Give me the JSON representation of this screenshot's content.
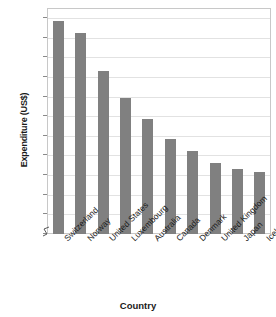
{
  "chart_data": {
    "type": "bar",
    "title": "",
    "xlabel": "Country",
    "ylabel": "Expenditure (US$)",
    "categories": [
      "Switzerland",
      "Norway",
      "United States",
      "Luxembourg",
      "Australia",
      "Canada",
      "Denmark",
      "United Kingdom",
      "Japan",
      "Iceland"
    ],
    "values": [
      41600,
      40400,
      36500,
      33800,
      31600,
      29600,
      28400,
      27100,
      26500,
      26200
    ],
    "ylim": [
      20000,
      42000
    ],
    "yticks": [
      0,
      20000,
      22000,
      24000,
      26000,
      28000,
      30000,
      32000,
      34000,
      36000,
      38000,
      40000,
      42000
    ],
    "ytick_labels": [
      "0",
      "20 000",
      "22 000",
      "24 000",
      "26 000",
      "28 000",
      "30 000",
      "32 000",
      "34 000",
      "36 000",
      "38 000",
      "40 000",
      "42 000"
    ],
    "axis_break": true,
    "axis_break_between": [
      0,
      20000
    ],
    "grid": true,
    "legend": null,
    "legend_position": "none",
    "colors": {
      "bar": "#808080",
      "grid": "#e2e2e2",
      "frame": "#c8c8c8",
      "text": "#1a1a1a",
      "background": "#ffffff"
    }
  }
}
